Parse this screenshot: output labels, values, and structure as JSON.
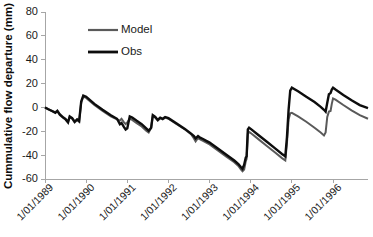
{
  "chart_data": {
    "type": "line",
    "title": "",
    "xlabel": "",
    "ylabel": "Cummulative flow departure (mm)",
    "ylim": [
      -60,
      80
    ],
    "yticks": [
      -60,
      -40,
      -20,
      0,
      20,
      40,
      60,
      80
    ],
    "ytick_labels": [
      "-60",
      "-40",
      "-20",
      "0",
      "20",
      "40",
      "60",
      "80"
    ],
    "xlim": [
      1989.0,
      1996.85
    ],
    "xticks": [
      1989,
      1990,
      1991,
      1992,
      1993,
      1994,
      1995,
      1996
    ],
    "xtick_labels": [
      "1/01/1989",
      "1/01/1990",
      "1/01/1991",
      "1/01/1992",
      "1/01/1993",
      "1/01/1994",
      "1/01/1995",
      "1/01/1996"
    ],
    "grid": false,
    "legend_position": "upper-left-inside",
    "legend": [
      {
        "name": "Model",
        "color": "#5a5a5a"
      },
      {
        "name": "Obs",
        "color": "#0d0d0d"
      }
    ],
    "series": [
      {
        "name": "Model",
        "color": "#5a5a5a",
        "linewidth": 2.0,
        "points": [
          [
            1989.0,
            0.0
          ],
          [
            1989.08,
            -1.5
          ],
          [
            1989.17,
            -3.0
          ],
          [
            1989.25,
            -4.0
          ],
          [
            1989.3,
            -2.5
          ],
          [
            1989.36,
            -5.5
          ],
          [
            1989.44,
            -8.0
          ],
          [
            1989.5,
            -9.5
          ],
          [
            1989.56,
            -12.0
          ],
          [
            1989.6,
            -8.0
          ],
          [
            1989.66,
            -9.5
          ],
          [
            1989.72,
            -12.5
          ],
          [
            1989.78,
            -10.5
          ],
          [
            1989.83,
            -12.0
          ],
          [
            1989.88,
            4.0
          ],
          [
            1989.93,
            9.0
          ],
          [
            1990.0,
            8.0
          ],
          [
            1990.2,
            2.0
          ],
          [
            1990.4,
            -3.0
          ],
          [
            1990.6,
            -7.5
          ],
          [
            1990.75,
            -10.0
          ],
          [
            1990.82,
            -11.0
          ],
          [
            1990.86,
            -9.5
          ],
          [
            1990.92,
            -12.5
          ],
          [
            1990.96,
            -14.0
          ],
          [
            1991.0,
            -12.5
          ],
          [
            1991.06,
            -9.5
          ],
          [
            1991.12,
            -10.5
          ],
          [
            1991.22,
            -13.0
          ],
          [
            1991.35,
            -16.0
          ],
          [
            1991.46,
            -19.5
          ],
          [
            1991.52,
            -21.0
          ],
          [
            1991.58,
            -17.0
          ],
          [
            1991.62,
            -7.0
          ],
          [
            1991.68,
            -8.5
          ],
          [
            1991.74,
            -11.0
          ],
          [
            1991.8,
            -9.0
          ],
          [
            1991.86,
            -10.0
          ],
          [
            1991.92,
            -8.5
          ],
          [
            1992.0,
            -9.5
          ],
          [
            1992.2,
            -14.0
          ],
          [
            1992.4,
            -18.5
          ],
          [
            1992.55,
            -22.5
          ],
          [
            1992.62,
            -26.0
          ],
          [
            1992.66,
            -28.5
          ],
          [
            1992.72,
            -25.5
          ],
          [
            1992.78,
            -27.0
          ],
          [
            1992.84,
            -28.0
          ],
          [
            1992.92,
            -29.5
          ],
          [
            1993.0,
            -31.0
          ],
          [
            1993.2,
            -36.0
          ],
          [
            1993.4,
            -41.0
          ],
          [
            1993.6,
            -46.0
          ],
          [
            1993.7,
            -49.0
          ],
          [
            1993.76,
            -52.0
          ],
          [
            1993.8,
            -53.5
          ],
          [
            1993.84,
            -52.0
          ],
          [
            1993.88,
            -45.0
          ],
          [
            1993.9,
            -43.0
          ],
          [
            1993.93,
            -22.0
          ],
          [
            1993.96,
            -20.5
          ],
          [
            1994.0,
            -21.5
          ],
          [
            1994.2,
            -27.0
          ],
          [
            1994.4,
            -32.5
          ],
          [
            1994.6,
            -38.0
          ],
          [
            1994.76,
            -42.5
          ],
          [
            1994.84,
            -44.5
          ],
          [
            1994.88,
            -30.0
          ],
          [
            1994.92,
            -10.0
          ],
          [
            1994.96,
            -5.0
          ],
          [
            1995.0,
            -4.5
          ],
          [
            1995.15,
            -7.5
          ],
          [
            1995.35,
            -12.0
          ],
          [
            1995.55,
            -17.0
          ],
          [
            1995.7,
            -21.0
          ],
          [
            1995.78,
            -23.5
          ],
          [
            1995.82,
            -21.0
          ],
          [
            1995.86,
            -8.0
          ],
          [
            1995.9,
            -3.5
          ],
          [
            1995.94,
            -3.0
          ],
          [
            1995.97,
            3.0
          ],
          [
            1996.0,
            7.5
          ],
          [
            1996.06,
            6.5
          ],
          [
            1996.25,
            2.0
          ],
          [
            1996.45,
            -2.5
          ],
          [
            1996.65,
            -6.5
          ],
          [
            1996.85,
            -9.5
          ]
        ]
      },
      {
        "name": "Obs",
        "color": "#0d0d0d",
        "linewidth": 2.4,
        "points": [
          [
            1989.0,
            0.0
          ],
          [
            1989.08,
            -1.5
          ],
          [
            1989.17,
            -3.0
          ],
          [
            1989.25,
            -4.5
          ],
          [
            1989.3,
            -3.0
          ],
          [
            1989.36,
            -6.0
          ],
          [
            1989.44,
            -8.5
          ],
          [
            1989.5,
            -10.0
          ],
          [
            1989.56,
            -12.5
          ],
          [
            1989.6,
            -7.5
          ],
          [
            1989.66,
            -9.0
          ],
          [
            1989.72,
            -12.0
          ],
          [
            1989.78,
            -10.0
          ],
          [
            1989.83,
            -11.5
          ],
          [
            1989.88,
            5.0
          ],
          [
            1989.93,
            10.0
          ],
          [
            1990.0,
            9.0
          ],
          [
            1990.2,
            3.0
          ],
          [
            1990.4,
            -2.0
          ],
          [
            1990.6,
            -6.5
          ],
          [
            1990.75,
            -9.5
          ],
          [
            1990.82,
            -14.0
          ],
          [
            1990.86,
            -13.0
          ],
          [
            1990.92,
            -16.5
          ],
          [
            1990.96,
            -18.5
          ],
          [
            1991.0,
            -17.5
          ],
          [
            1991.06,
            -7.5
          ],
          [
            1991.12,
            -8.5
          ],
          [
            1991.22,
            -11.0
          ],
          [
            1991.35,
            -14.0
          ],
          [
            1991.46,
            -17.5
          ],
          [
            1991.52,
            -19.5
          ],
          [
            1991.58,
            -17.0
          ],
          [
            1991.62,
            -6.5
          ],
          [
            1991.68,
            -8.0
          ],
          [
            1991.74,
            -10.5
          ],
          [
            1991.8,
            -8.5
          ],
          [
            1991.86,
            -9.5
          ],
          [
            1991.92,
            -8.0
          ],
          [
            1992.0,
            -9.0
          ],
          [
            1992.2,
            -13.5
          ],
          [
            1992.4,
            -18.0
          ],
          [
            1992.55,
            -22.0
          ],
          [
            1992.62,
            -24.0
          ],
          [
            1992.66,
            -26.0
          ],
          [
            1992.72,
            -24.0
          ],
          [
            1992.78,
            -25.5
          ],
          [
            1992.84,
            -26.5
          ],
          [
            1992.92,
            -28.0
          ],
          [
            1993.0,
            -29.5
          ],
          [
            1993.2,
            -34.5
          ],
          [
            1993.4,
            -39.5
          ],
          [
            1993.6,
            -44.5
          ],
          [
            1993.7,
            -47.5
          ],
          [
            1993.76,
            -50.0
          ],
          [
            1993.8,
            -51.5
          ],
          [
            1993.84,
            -48.0
          ],
          [
            1993.88,
            -42.0
          ],
          [
            1993.9,
            -41.0
          ],
          [
            1993.93,
            -18.5
          ],
          [
            1993.96,
            -17.0
          ],
          [
            1994.0,
            -18.0
          ],
          [
            1994.2,
            -23.5
          ],
          [
            1994.4,
            -29.0
          ],
          [
            1994.6,
            -34.5
          ],
          [
            1994.76,
            -39.0
          ],
          [
            1994.84,
            -41.0
          ],
          [
            1994.88,
            -25.0
          ],
          [
            1994.92,
            -2.0
          ],
          [
            1994.96,
            14.0
          ],
          [
            1995.0,
            16.5
          ],
          [
            1995.15,
            13.5
          ],
          [
            1995.35,
            9.0
          ],
          [
            1995.55,
            4.5
          ],
          [
            1995.7,
            0.5
          ],
          [
            1995.78,
            -2.0
          ],
          [
            1995.82,
            -3.5
          ],
          [
            1995.86,
            4.0
          ],
          [
            1995.9,
            11.0
          ],
          [
            1995.94,
            12.0
          ],
          [
            1995.97,
            15.0
          ],
          [
            1996.0,
            16.5
          ],
          [
            1996.06,
            15.0
          ],
          [
            1996.25,
            10.5
          ],
          [
            1996.45,
            6.0
          ],
          [
            1996.65,
            2.0
          ],
          [
            1996.85,
            -0.5
          ]
        ]
      }
    ]
  },
  "figure": {
    "caption_fragment": ""
  }
}
